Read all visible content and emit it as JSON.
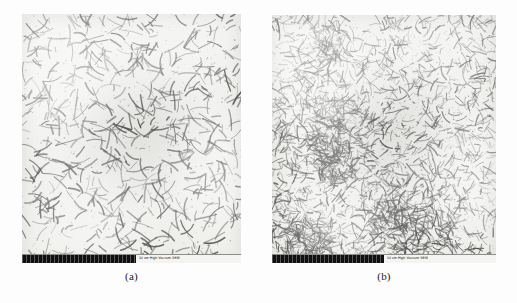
{
  "figure": {
    "background_color": "#fdfdfd",
    "panel_background_color": "#ededea",
    "fiber_color": "#3a3a3a",
    "scalebar_color": "#101010"
  },
  "panels": [
    {
      "id": "a",
      "caption": "(a)",
      "alt": "Optical micrograph of composite microstructure with sparse, short, randomly oriented dark fibers dispersed in a light matrix",
      "scalebar": {
        "bar_fraction": 0.52,
        "info_text": "50 um  High Vacuum  SEM"
      },
      "field": {
        "density": 620,
        "mean_length": 13,
        "length_spread": 9,
        "thickness": 1.15,
        "darkness": 0.78,
        "clustered": false,
        "seed": 1347
      }
    },
    {
      "id": "b",
      "caption": "(b)",
      "alt": "Optical micrograph of composite microstructure with a dense network of fine, randomly oriented dark fibers nearly covering the light matrix",
      "scalebar": {
        "bar_fraction": 0.5,
        "info_text": "50 um  High Vacuum  SEM"
      },
      "field": {
        "density": 2450,
        "mean_length": 9,
        "length_spread": 7,
        "thickness": 0.95,
        "darkness": 0.7,
        "clustered": true,
        "seed": 8821
      }
    }
  ]
}
